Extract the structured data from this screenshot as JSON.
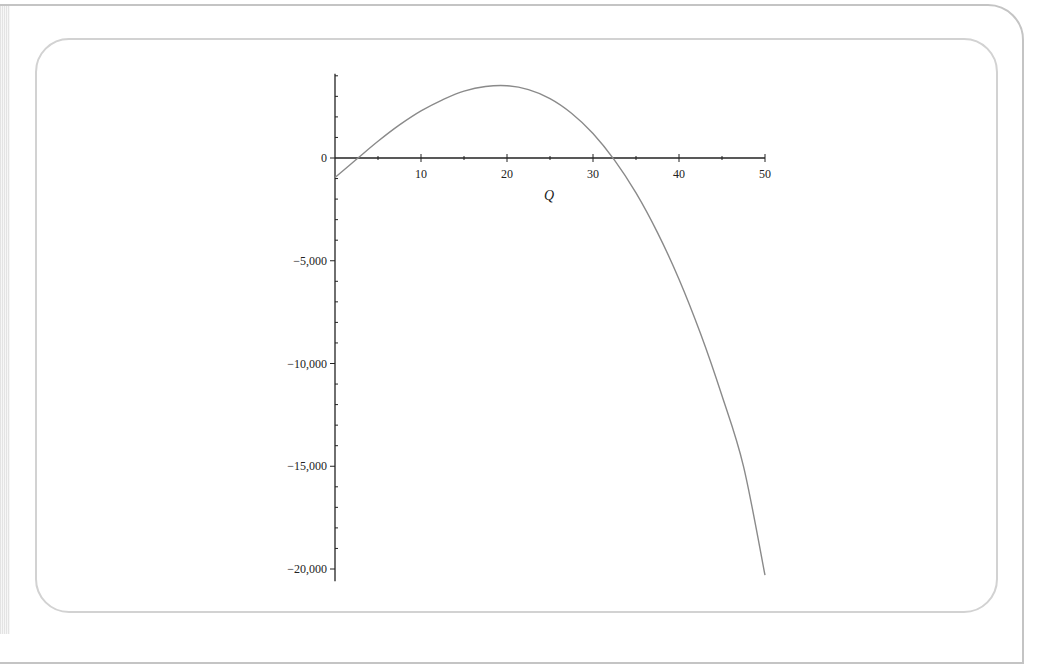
{
  "chart_data": {
    "type": "line",
    "title": "",
    "xlabel": "Q",
    "ylabel": "",
    "xlim": [
      0,
      50
    ],
    "ylim": [
      -20500,
      4000
    ],
    "grid": false,
    "legend": null,
    "x_ticks": [
      10,
      20,
      30,
      40,
      50
    ],
    "x_tick_labels": [
      "10",
      "20",
      "30",
      "40",
      "50"
    ],
    "x_minor_step": 5,
    "y_ticks": [
      0,
      -5000,
      -10000,
      -15000,
      -20000
    ],
    "y_tick_labels": [
      "0",
      "-5,000",
      "-10,000",
      "-15,000",
      "-20,000"
    ],
    "y_minor_step": 1000,
    "series": [
      {
        "name": "profit",
        "color": "#8a8a8a",
        "x": [
          0,
          2.5,
          5,
          7.5,
          10,
          12.5,
          15,
          17.5,
          20,
          22.5,
          25,
          27.5,
          30,
          32.5,
          35,
          37.5,
          40,
          42.5,
          45,
          47.5,
          50
        ],
        "y": [
          -950,
          -64,
          815,
          1610,
          2290,
          2830,
          3250,
          3480,
          3520,
          3330,
          2890,
          2180,
          1190,
          -100,
          -1700,
          -3630,
          -5900,
          -8540,
          -11570,
          -15000,
          -20300
        ]
      }
    ],
    "annotations": {
      "max_point": {
        "Q": 20,
        "value": 3940
      },
      "zero_crossings": [
        3,
        33
      ]
    }
  },
  "colors": {
    "frame": "#c4c4c4",
    "inner_frame": "#d2d2d2",
    "axis": "#222222",
    "curve": "#8a8a8a"
  }
}
